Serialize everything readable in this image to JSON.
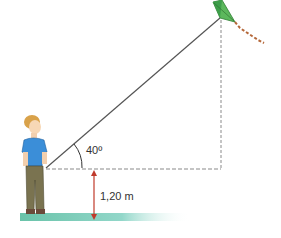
{
  "diagram": {
    "angle_label": "40º",
    "height_label": "1,20 m",
    "colors": {
      "string": "#555555",
      "dashed": "#8a8a8a",
      "arrow": "#c0392b",
      "kite": "#4caf50",
      "ground": "#4fb89a",
      "shirt": "#3b8ed8",
      "pants": "#7a7350",
      "hair": "#d9a24a"
    }
  }
}
